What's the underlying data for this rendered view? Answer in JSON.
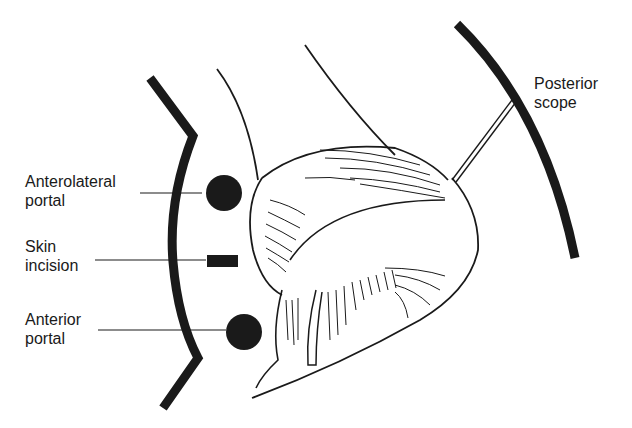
{
  "diagram": {
    "type": "anatomical-illustration",
    "labels": {
      "anterolateral_portal": {
        "line1": "Anterolateral",
        "line2": "portal"
      },
      "skin_incision": {
        "line1": "Skin",
        "line2": "incision"
      },
      "anterior_portal": {
        "line1": "Anterior",
        "line2": "portal"
      },
      "posterior_scope": {
        "line1": "Posterior",
        "line2": "scope"
      }
    },
    "markers": [
      {
        "name": "anterolateral-portal",
        "shape": "circle",
        "cx": 224,
        "cy": 193,
        "r": 18
      },
      {
        "name": "skin-incision",
        "shape": "rect",
        "x": 207,
        "y": 256,
        "w": 31,
        "h": 12
      },
      {
        "name": "anterior-portal",
        "shape": "circle",
        "cx": 244,
        "cy": 332,
        "r": 18
      }
    ],
    "colors": {
      "ink": "#1a1a1a",
      "background": "#ffffff"
    }
  }
}
